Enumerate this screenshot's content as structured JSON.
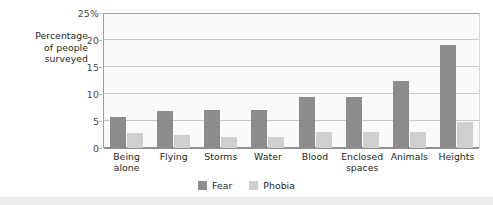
{
  "chart_data": {
    "type": "bar",
    "title": "",
    "xlabel": "",
    "ylabel": "Percentage of people surveyed",
    "ylim": [
      0,
      25
    ],
    "ytick_labels": [
      "25%",
      "20",
      "15",
      "10",
      "5",
      "0"
    ],
    "ytick_values": [
      25,
      20,
      15,
      10,
      5,
      0
    ],
    "grid": true,
    "legend_position": "bottom-center",
    "categories": [
      "Being alone",
      "Flying",
      "Storms",
      "Water",
      "Blood",
      "Enclosed spaces",
      "Animals",
      "Heights"
    ],
    "series": [
      {
        "name": "Fear",
        "color": "#8c8c8c",
        "values": [
          5.8,
          6.9,
          7.0,
          7.1,
          9.4,
          9.4,
          12.4,
          19.0
        ]
      },
      {
        "name": "Phobia",
        "color": "#cfcfcf",
        "values": [
          2.8,
          2.5,
          2.0,
          2.1,
          3.0,
          3.0,
          3.0,
          4.8
        ]
      }
    ]
  },
  "axis": {
    "y_title_lines": [
      "Percentage",
      "of people",
      "surveyed"
    ]
  },
  "legend": {
    "items": [
      {
        "label": "Fear",
        "swatch": "legend-swatch-fear"
      },
      {
        "label": "Phobia",
        "swatch": "legend-swatch-phobia"
      }
    ]
  }
}
